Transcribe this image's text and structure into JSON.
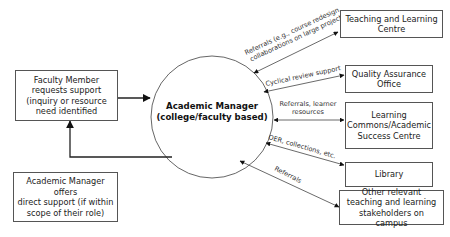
{
  "diagram": {
    "center": {
      "label": "Academic Manager\n(college/faculty based)"
    },
    "left_boxes": {
      "faculty_member": "Faculty Member\nrequests support\n(inquiry or resource\nneed identified",
      "direct_support": "Academic Manager offers\ndirect support (if within\nscope of their role)"
    },
    "right_boxes": [
      {
        "id": "teaching-learning-centre",
        "label": "Teaching and Learning\nCentre"
      },
      {
        "id": "quality-assurance-office",
        "label": "Quality Assurance\nOffice"
      },
      {
        "id": "learning-commons",
        "label": "Learning\nCommons/Academic\nSuccess Centre"
      },
      {
        "id": "library",
        "label": "Library"
      },
      {
        "id": "other-stakeholders",
        "label": "Other relevant\nteaching and learning\nstakeholders on campus"
      }
    ],
    "edge_labels": {
      "teaching_line1": "Referrals (e.g., course redesign,",
      "teaching_line2": "collaborations on large projects)",
      "quality": "Cyclical review support",
      "learning_line1": "Referrals, learner",
      "learning_line2": "resources",
      "library": "OER, collections, etc.",
      "other": "Referrals"
    },
    "colors": {
      "line": "#444444",
      "border": "#555555",
      "text": "#222222"
    }
  }
}
